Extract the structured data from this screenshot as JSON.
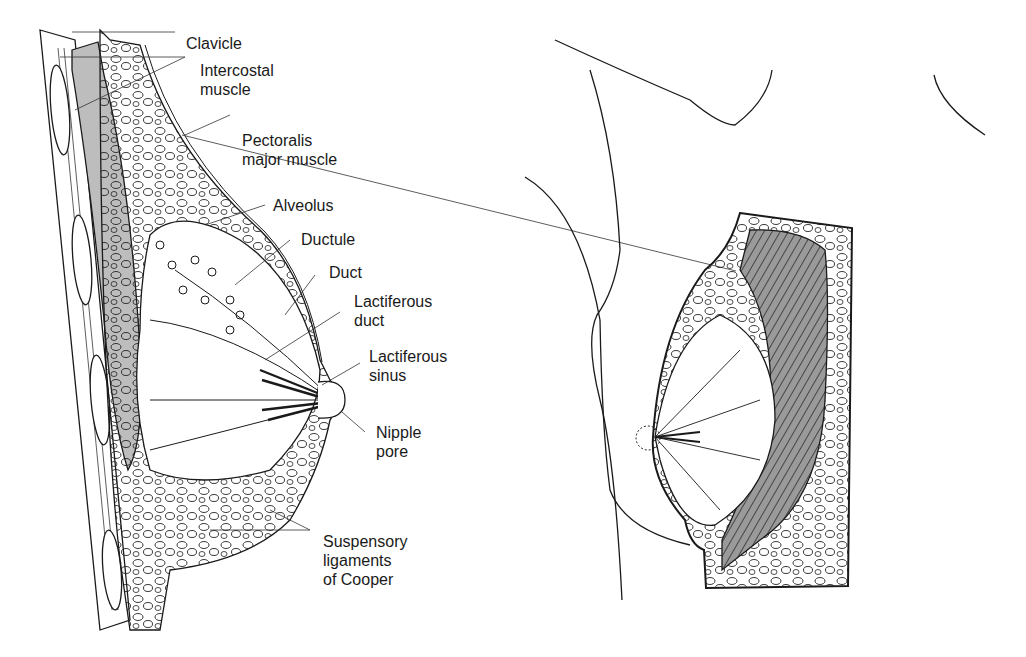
{
  "labels": {
    "clavicle": "Clavicle",
    "intercostal": "Intercostal\nmuscle",
    "pectoralis": "Pectoralis\nmajor muscle",
    "alveolus": "Alveolus",
    "ductule": "Ductule",
    "duct": "Duct",
    "lactiferous_duct": "Lactiferous\nduct",
    "lactiferous_sinus": "Lactiferous\nsinus",
    "nipple_pore": "Nipple\npore",
    "suspensory": "Suspensory\nligaments\nof Cooper"
  },
  "colors": {
    "line": "#1a1a1a",
    "muscle_fill": "#bdbdbd",
    "background": "#ffffff"
  }
}
